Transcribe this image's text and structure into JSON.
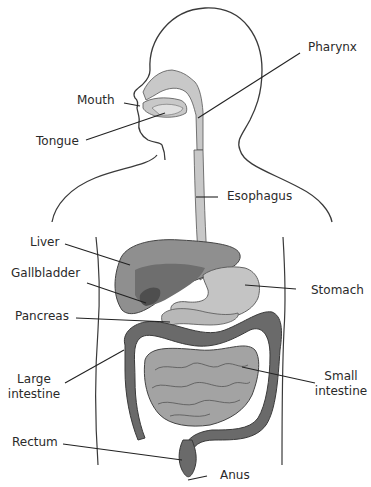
{
  "diagram": {
    "colors": {
      "outline": "#3a3a3a",
      "tract_light": "#c8c8c8",
      "liver": "#8f8f8f",
      "liver_dark": "#6e6e6e",
      "gallbladder": "#4e4e4e",
      "stomach": "#c4c4c4",
      "pancreas": "#b8b8b8",
      "large_intestine": "#6a6a6a",
      "small_intestine": "#a3a3a3",
      "leader_line": "#222222"
    },
    "labels": {
      "pharynx": "Pharynx",
      "mouth": "Mouth",
      "tongue": "Tongue",
      "esophagus": "Esophagus",
      "liver": "Liver",
      "gallbladder": "Gallbladder",
      "stomach": "Stomach",
      "pancreas": "Pancreas",
      "large_intestine_line1": "Large",
      "large_intestine_line2": "intestine",
      "small_intestine_line1": "Small",
      "small_intestine_line2": "intestine",
      "rectum": "Rectum",
      "anus": "Anus"
    }
  }
}
